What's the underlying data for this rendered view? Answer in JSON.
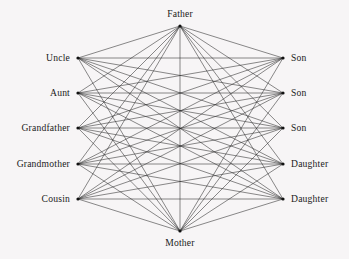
{
  "figure": {
    "background_color": "#f7f5f6",
    "edge_color": "#2a2a2a",
    "node_color": "#111111",
    "text_color": "#1b1b1b",
    "width": 349,
    "height": 259
  },
  "chart_data": {
    "type": "diagram",
    "diagram_kind": "node-link-graph",
    "title": "",
    "layout": "bipartite-with-two-hubs",
    "nodes": [
      {
        "id": "father",
        "label": "Father",
        "group": "top",
        "x": 180,
        "y": 26,
        "label_pos": "top"
      },
      {
        "id": "mother",
        "label": "Mother",
        "group": "bottom",
        "x": 180,
        "y": 231,
        "label_pos": "bottom"
      },
      {
        "id": "uncle",
        "label": "Uncle",
        "group": "left",
        "x": 78,
        "y": 58,
        "label_pos": "left"
      },
      {
        "id": "aunt",
        "label": "Aunt",
        "group": "left",
        "x": 78,
        "y": 93,
        "label_pos": "left"
      },
      {
        "id": "grandfather",
        "label": "Grandfather",
        "group": "left",
        "x": 78,
        "y": 128,
        "label_pos": "left"
      },
      {
        "id": "grandmother",
        "label": "Grandmother",
        "group": "left",
        "x": 78,
        "y": 164,
        "label_pos": "left"
      },
      {
        "id": "cousin",
        "label": "Cousin",
        "group": "left",
        "x": 78,
        "y": 199,
        "label_pos": "left"
      },
      {
        "id": "son1",
        "label": "Son",
        "group": "right",
        "x": 283,
        "y": 58,
        "label_pos": "right"
      },
      {
        "id": "son2",
        "label": "Son",
        "group": "right",
        "x": 283,
        "y": 93,
        "label_pos": "right"
      },
      {
        "id": "son3",
        "label": "Son",
        "group": "right",
        "x": 283,
        "y": 128,
        "label_pos": "right"
      },
      {
        "id": "daughter1",
        "label": "Daughter",
        "group": "right",
        "x": 283,
        "y": 164,
        "label_pos": "right"
      },
      {
        "id": "daughter2",
        "label": "Daughter",
        "group": "right",
        "x": 283,
        "y": 199,
        "label_pos": "right"
      }
    ],
    "edges": [
      [
        "father",
        "uncle"
      ],
      [
        "father",
        "aunt"
      ],
      [
        "father",
        "grandfather"
      ],
      [
        "father",
        "grandmother"
      ],
      [
        "father",
        "cousin"
      ],
      [
        "father",
        "son1"
      ],
      [
        "father",
        "son2"
      ],
      [
        "father",
        "son3"
      ],
      [
        "father",
        "daughter1"
      ],
      [
        "father",
        "daughter2"
      ],
      [
        "father",
        "mother"
      ],
      [
        "mother",
        "uncle"
      ],
      [
        "mother",
        "aunt"
      ],
      [
        "mother",
        "grandfather"
      ],
      [
        "mother",
        "grandmother"
      ],
      [
        "mother",
        "cousin"
      ],
      [
        "mother",
        "son1"
      ],
      [
        "mother",
        "son2"
      ],
      [
        "mother",
        "son3"
      ],
      [
        "mother",
        "daughter1"
      ],
      [
        "mother",
        "daughter2"
      ],
      [
        "uncle",
        "son1"
      ],
      [
        "uncle",
        "son2"
      ],
      [
        "uncle",
        "son3"
      ],
      [
        "uncle",
        "daughter1"
      ],
      [
        "uncle",
        "daughter2"
      ],
      [
        "aunt",
        "son1"
      ],
      [
        "aunt",
        "son2"
      ],
      [
        "aunt",
        "son3"
      ],
      [
        "aunt",
        "daughter1"
      ],
      [
        "aunt",
        "daughter2"
      ],
      [
        "grandfather",
        "son1"
      ],
      [
        "grandfather",
        "son2"
      ],
      [
        "grandfather",
        "son3"
      ],
      [
        "grandfather",
        "daughter1"
      ],
      [
        "grandfather",
        "daughter2"
      ],
      [
        "grandmother",
        "son1"
      ],
      [
        "grandmother",
        "son2"
      ],
      [
        "grandmother",
        "son3"
      ],
      [
        "grandmother",
        "daughter1"
      ],
      [
        "grandmother",
        "daughter2"
      ],
      [
        "cousin",
        "son1"
      ],
      [
        "cousin",
        "son2"
      ],
      [
        "cousin",
        "son3"
      ],
      [
        "cousin",
        "daughter1"
      ],
      [
        "cousin",
        "daughter2"
      ]
    ],
    "node_count": 12,
    "edge_count": 46,
    "labels": {
      "top": "Father",
      "bottom": "Mother",
      "left": [
        "Uncle",
        "Aunt",
        "Grandfather",
        "Grandmother",
        "Cousin"
      ],
      "right": [
        "Son",
        "Son",
        "Son",
        "Daughter",
        "Daughter"
      ]
    }
  }
}
